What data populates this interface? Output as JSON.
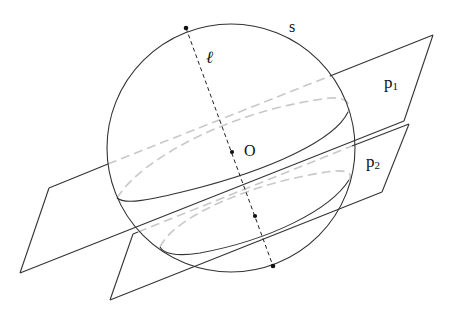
{
  "diagram": {
    "type": "sphere cut by two parallel planes",
    "labels": {
      "sphere": "s",
      "line": "ℓ",
      "center": "O",
      "plane1": "p",
      "plane1_sub": "1",
      "plane2": "p",
      "plane2_sub": "2"
    },
    "colors": {
      "line": "#333333",
      "hidden": "#c8c8c8",
      "point": "#111111"
    },
    "sphere": {
      "cx": 231,
      "cy": 148,
      "r": 124
    },
    "points": [
      {
        "name": "top-pole",
        "x": 186,
        "y": 28
      },
      {
        "name": "O",
        "x": 232,
        "y": 152
      },
      {
        "name": "lower-point",
        "x": 255,
        "y": 216
      },
      {
        "name": "bottom-pole",
        "x": 273,
        "y": 266
      }
    ],
    "planes": [
      {
        "name": "p1",
        "corners": [
          [
            49,
            188
          ],
          [
            433,
            35
          ],
          [
            404,
            121
          ],
          [
            20,
            273
          ]
        ]
      },
      {
        "name": "p2",
        "corners": [
          [
            133,
            234
          ],
          [
            409,
            124
          ],
          [
            382,
            192
          ],
          [
            110,
            300
          ]
        ]
      }
    ]
  }
}
